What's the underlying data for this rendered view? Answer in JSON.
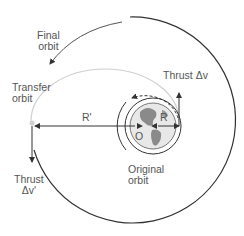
{
  "diagram": {
    "labels": {
      "final_orbit_line1": "Final",
      "final_orbit_line2": "orbit",
      "transfer_orbit_line1": "Transfer",
      "transfer_orbit_line2": "orbit",
      "thrust_dv": "Thrust Δv",
      "thrust_dv_prime_line1": "Thrust",
      "thrust_dv_prime_line2": "Δv'",
      "radius_r": "R",
      "radius_r_prime": "R'",
      "center_o": "O",
      "original_orbit_line1": "Original",
      "original_orbit_line2": "orbit"
    },
    "colors": {
      "line": "#333333",
      "transfer": "#cccccc",
      "earth_land": "#8a8a8a",
      "earth_sea": "#e6e6e6",
      "text": "#555555"
    }
  }
}
